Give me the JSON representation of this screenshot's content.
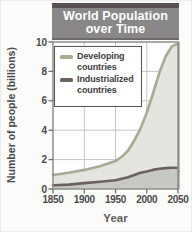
{
  "figure_name": "world-population-over-time-chart",
  "chart_data": {
    "type": "area",
    "title": "World Population over Time",
    "title_lines": [
      "World Population",
      "over Time"
    ],
    "xlabel": "Year",
    "ylabel": "Number of people (billions)",
    "xlim": [
      1850,
      2050
    ],
    "ylim": [
      0,
      10
    ],
    "x_ticks": [
      1850,
      1900,
      1950,
      2000,
      2050
    ],
    "y_ticks": [
      0,
      2,
      4,
      6,
      8,
      10
    ],
    "grid": true,
    "legend_position": "upper left",
    "series": [
      {
        "name": "Developing countries",
        "line_color": "#a2ac93",
        "fill_color": "#e4e5de",
        "x": [
          1850,
          1875,
          1900,
          1925,
          1950,
          1960,
          1970,
          1980,
          1990,
          2000,
          2010,
          2020,
          2030,
          2040,
          2050
        ],
        "values": [
          0.95,
          1.1,
          1.3,
          1.55,
          1.9,
          2.2,
          2.6,
          3.3,
          4.1,
          5.2,
          6.5,
          7.9,
          9.0,
          9.7,
          9.9
        ]
      },
      {
        "name": "Industrialized countries",
        "line_color": "#6b625d",
        "fill_color": "#c8c8c3",
        "x": [
          1850,
          1875,
          1900,
          1925,
          1950,
          1960,
          1970,
          1980,
          1990,
          2000,
          2010,
          2020,
          2030,
          2040,
          2050
        ],
        "values": [
          0.25,
          0.3,
          0.4,
          0.5,
          0.6,
          0.7,
          0.8,
          0.95,
          1.1,
          1.2,
          1.3,
          1.38,
          1.42,
          1.45,
          1.45
        ]
      }
    ]
  },
  "colors": {
    "title_bar_bg": "#898788",
    "title_bar_top_strip": "#565051",
    "title_text": "#ffffff",
    "gridline": "#c6c6c1",
    "plot_border": "#8f8f8a",
    "tick_text": "#494949",
    "plot_bg": "#ffffff"
  }
}
